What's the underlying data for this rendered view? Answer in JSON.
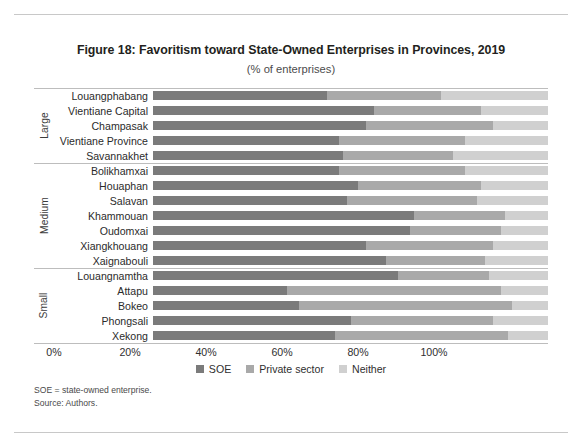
{
  "chart_data": {
    "type": "bar",
    "subtype": "stacked-horizontal-100",
    "title": "Figure 18: Favoritism toward State-Owned Enterprises in Provinces, 2019",
    "subtitle": "(% of enterprises)",
    "xlabel": "",
    "ylabel": "",
    "xlim": [
      0,
      100
    ],
    "xticks": [
      "0%",
      "20%",
      "40%",
      "60%",
      "80%",
      "100%"
    ],
    "xtick_values": [
      0,
      20,
      40,
      60,
      80,
      100
    ],
    "grid": false,
    "legend_position": "bottom-center",
    "legend": [
      "SOE",
      "Private sector",
      "Neither"
    ],
    "colors": {
      "SOE": "#7b7b7b",
      "Private sector": "#a9a9a9",
      "Neither": "#d0d0d0"
    },
    "categories": [
      "Louangphabang",
      "Vientiane Capital",
      "Champasak",
      "Vientiane Province",
      "Savannakhet",
      "Bolikhamxai",
      "Houaphan",
      "Salavan",
      "Khammouan",
      "Oudomxai",
      "Xiangkhouang",
      "Xaignabouli",
      "Louangnamtha",
      "Attapu",
      "Bokeo",
      "Phongsali",
      "Xekong"
    ],
    "groups": [
      {
        "label": "Large",
        "categories": [
          "Louangphabang",
          "Vientiane Capital",
          "Champasak",
          "Vientiane Province",
          "Savannakhet"
        ]
      },
      {
        "label": "Medium",
        "categories": [
          "Bolikhamxai",
          "Houaphan",
          "Salavan",
          "Khammouan",
          "Oudomxai",
          "Xiangkhouang",
          "Xaignabouli"
        ]
      },
      {
        "label": "Small",
        "categories": [
          "Louangnamtha",
          "Attapu",
          "Bokeo",
          "Phongsali",
          "Xekong"
        ]
      }
    ],
    "series": [
      {
        "name": "SOE",
        "values": [
          44,
          56,
          54,
          47,
          48,
          47,
          52,
          49,
          66,
          65,
          54,
          59,
          62,
          34,
          37,
          50,
          46
        ]
      },
      {
        "name": "Private sector",
        "values": [
          73,
          83,
          86,
          79,
          76,
          79,
          83,
          82,
          89,
          88,
          86,
          84,
          85,
          88,
          91,
          86,
          90
        ]
      },
      {
        "name": "Neither",
        "values": [
          100,
          100,
          100,
          100,
          100,
          100,
          100,
          100,
          100,
          100,
          100,
          100,
          100,
          100,
          100,
          100,
          100
        ]
      }
    ],
    "stacks": [
      {
        "category": "Louangphabang",
        "group": "Large",
        "SOE": 44,
        "Private sector": 29,
        "Neither": 27
      },
      {
        "category": "Vientiane Capital",
        "group": "Large",
        "SOE": 56,
        "Private sector": 27,
        "Neither": 17
      },
      {
        "category": "Champasak",
        "group": "Large",
        "SOE": 54,
        "Private sector": 32,
        "Neither": 14
      },
      {
        "category": "Vientiane Province",
        "group": "Large",
        "SOE": 47,
        "Private sector": 32,
        "Neither": 21
      },
      {
        "category": "Savannakhet",
        "group": "Large",
        "SOE": 48,
        "Private sector": 28,
        "Neither": 24
      },
      {
        "category": "Bolikhamxai",
        "group": "Medium",
        "SOE": 47,
        "Private sector": 32,
        "Neither": 21
      },
      {
        "category": "Houaphan",
        "group": "Medium",
        "SOE": 52,
        "Private sector": 31,
        "Neither": 17
      },
      {
        "category": "Salavan",
        "group": "Medium",
        "SOE": 49,
        "Private sector": 33,
        "Neither": 18
      },
      {
        "category": "Khammouan",
        "group": "Medium",
        "SOE": 66,
        "Private sector": 23,
        "Neither": 11
      },
      {
        "category": "Oudomxai",
        "group": "Medium",
        "SOE": 65,
        "Private sector": 23,
        "Neither": 12
      },
      {
        "category": "Xiangkhouang",
        "group": "Medium",
        "SOE": 54,
        "Private sector": 32,
        "Neither": 14
      },
      {
        "category": "Xaignabouli",
        "group": "Medium",
        "SOE": 59,
        "Private sector": 25,
        "Neither": 16
      },
      {
        "category": "Louangnamtha",
        "group": "Small",
        "SOE": 62,
        "Private sector": 23,
        "Neither": 15
      },
      {
        "category": "Attapu",
        "group": "Small",
        "SOE": 34,
        "Private sector": 54,
        "Neither": 12
      },
      {
        "category": "Bokeo",
        "group": "Small",
        "SOE": 37,
        "Private sector": 54,
        "Neither": 9
      },
      {
        "category": "Phongsali",
        "group": "Small",
        "SOE": 50,
        "Private sector": 36,
        "Neither": 14
      },
      {
        "category": "Xekong",
        "group": "Small",
        "SOE": 46,
        "Private sector": 44,
        "Neither": 10
      }
    ]
  },
  "notes": {
    "line1": "SOE = state-owned enterprise.",
    "line2": "Source: Authors."
  }
}
